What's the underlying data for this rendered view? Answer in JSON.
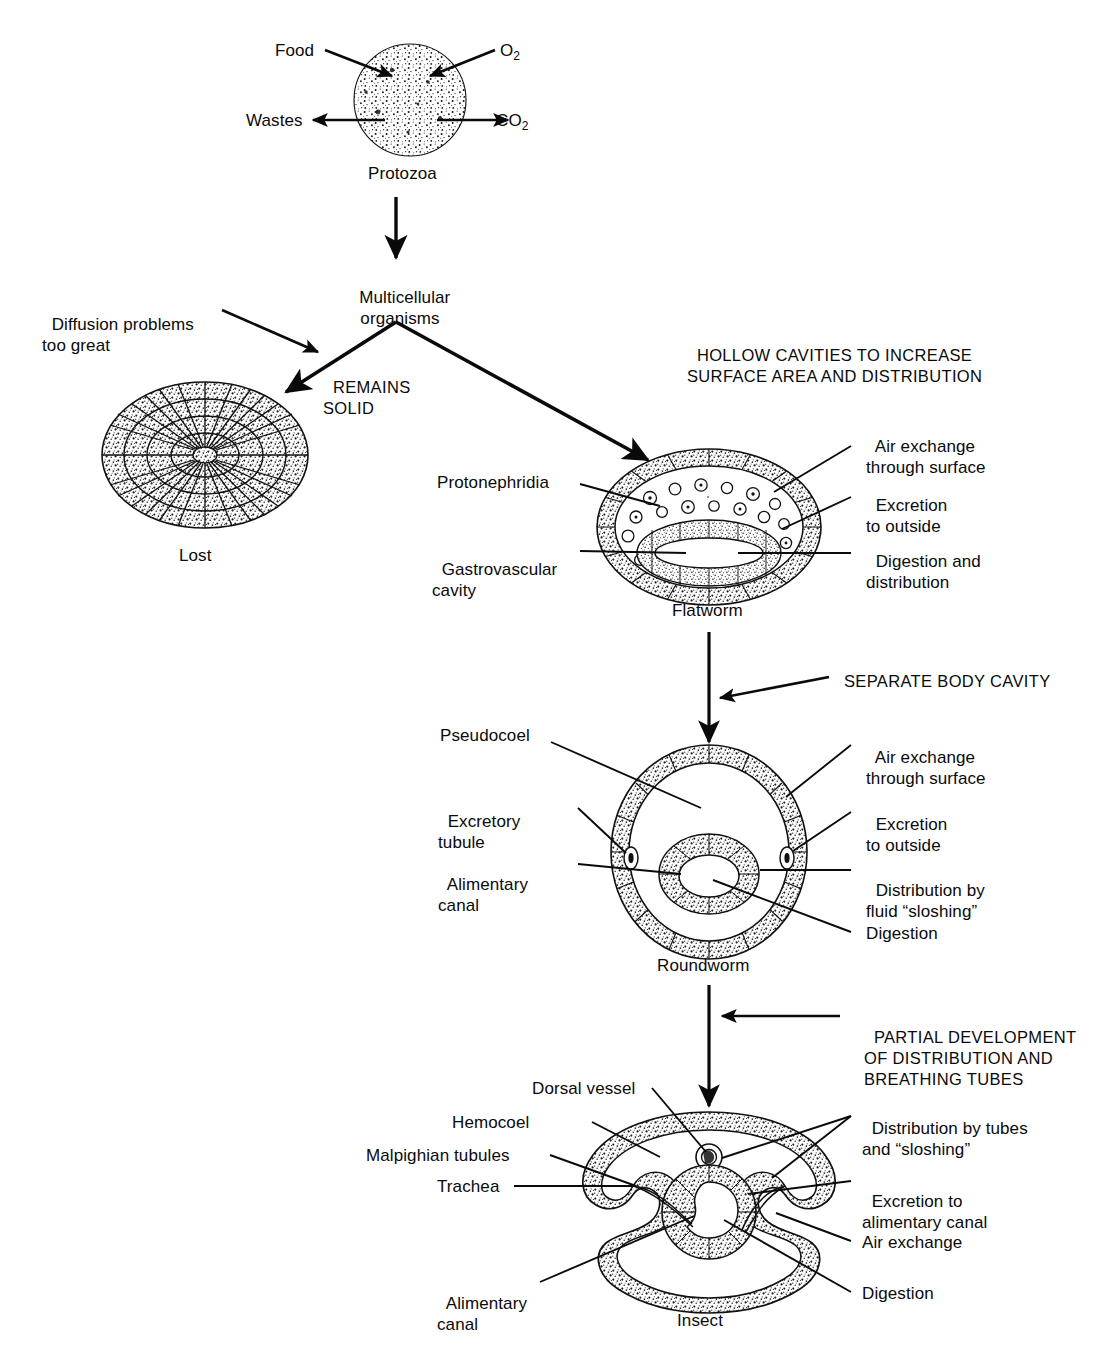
{
  "diagram": {
    "type": "flow-diagram"
  },
  "stages": {
    "protozoa": {
      "name": "Protozoa",
      "inputs": [
        {
          "label": "Food",
          "direction": "in-left"
        },
        {
          "label": "O2",
          "base": "O",
          "sub": "2",
          "direction": "in-right"
        }
      ],
      "outputs": [
        {
          "label": "Wastes",
          "direction": "out-left"
        },
        {
          "label": "CO2",
          "base": "CO",
          "sub": "2",
          "direction": "out-right"
        }
      ]
    },
    "multicellular": {
      "line1": "Multicellular",
      "line2": "organisms"
    },
    "solid": {
      "name": "Lost",
      "branch_label_line1": "REMAINS",
      "branch_label_line2": "SOLID",
      "reason_line1": "Diffusion problems",
      "reason_line2": "too great"
    },
    "flatworm": {
      "name": "Flatworm",
      "transition_line1": "HOLLOW CAVITIES TO INCREASE",
      "transition_line2": "SURFACE AREA AND DISTRIBUTION",
      "labels_left": [
        {
          "text": "Protonephridia"
        },
        {
          "line1": "Gastrovascular",
          "line2": "cavity"
        }
      ],
      "labels_right": [
        {
          "line1": "Air exchange",
          "line2": "through surface"
        },
        {
          "line1": "Excretion",
          "line2": "to outside"
        },
        {
          "line1": "Digestion and",
          "line2": "distribution"
        }
      ]
    },
    "roundworm": {
      "name": "Roundworm",
      "transition_line1": "SEPARATE BODY CAVITY",
      "labels_left": [
        {
          "text": "Pseudocoel"
        },
        {
          "line1": "Excretory",
          "line2": "tubule"
        },
        {
          "line1": "Alimentary",
          "line2": "canal"
        }
      ],
      "labels_right": [
        {
          "line1": "Air exchange",
          "line2": "through surface"
        },
        {
          "line1": "Excretion",
          "line2": "to outside"
        },
        {
          "line1": "Distribution by",
          "line2": "fluid “sloshing”"
        },
        {
          "line1": "Digestion"
        }
      ]
    },
    "insect": {
      "name": "Insect",
      "transition_line1": "PARTIAL DEVELOPMENT",
      "transition_line2": "OF DISTRIBUTION AND",
      "transition_line3": "BREATHING TUBES",
      "labels_left": [
        {
          "text": "Dorsal vessel"
        },
        {
          "text": "Hemocoel"
        },
        {
          "text": "Malpighian tubules"
        },
        {
          "text": "Trachea"
        },
        {
          "line1": "Alimentary",
          "line2": "canal"
        }
      ],
      "labels_right": [
        {
          "line1": "Distribution by tubes",
          "line2": "and “sloshing”"
        },
        {
          "line1": "Excretion to",
          "line2": "alimentary canal"
        },
        {
          "line1": "Air exchange"
        },
        {
          "line1": "Digestion"
        }
      ]
    }
  },
  "colors": {
    "ink": "#0a0a0a",
    "paper": "#ffffff",
    "stipple": "#1a1a1a"
  }
}
